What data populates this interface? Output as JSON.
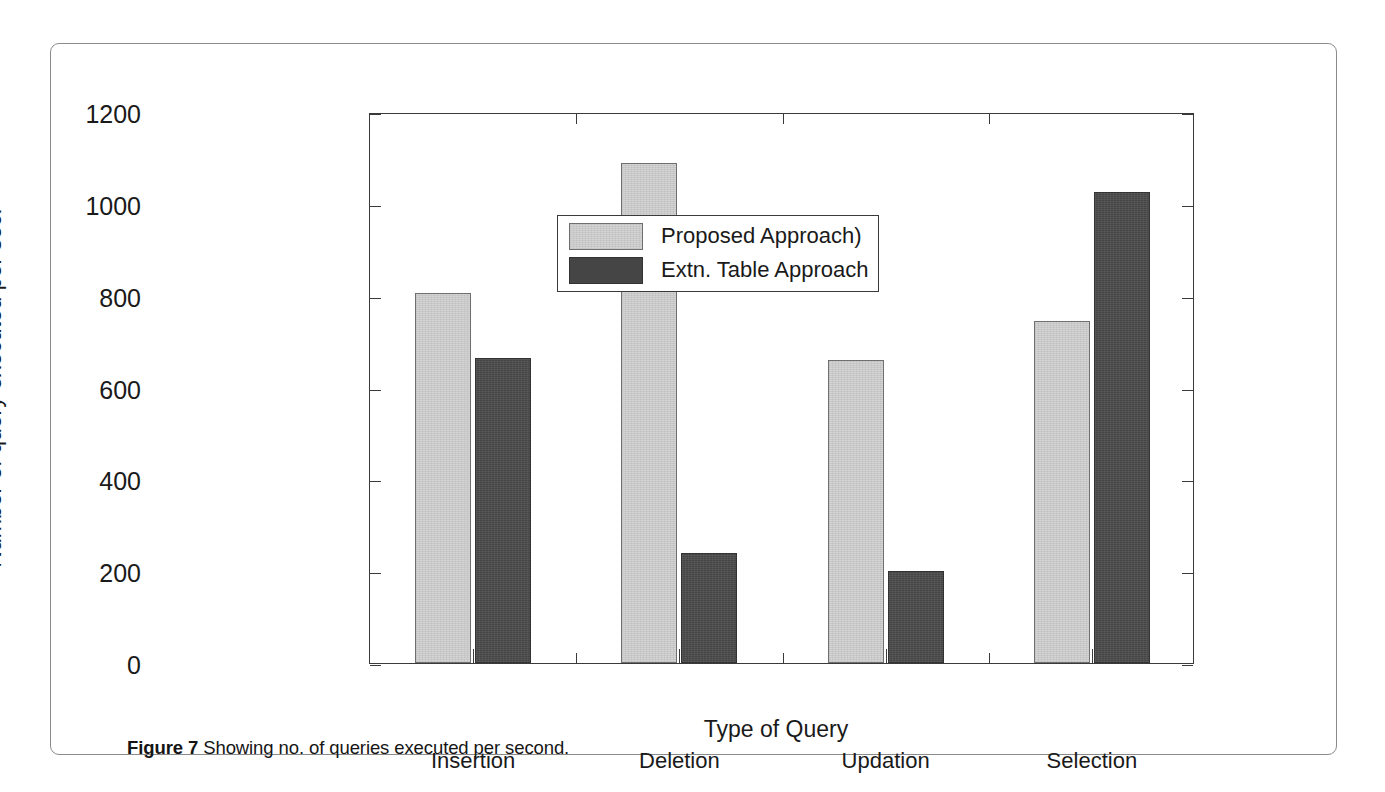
{
  "figure": {
    "caption_label": "Figure 7",
    "caption_text": "Showing no. of queries executed per second."
  },
  "chart_data": {
    "type": "bar",
    "title": "",
    "xlabel": "Type of Query",
    "ylabel": "Number of query executed per sec.",
    "categories": [
      "Insertion",
      "Deletion",
      "Updation",
      "Selection"
    ],
    "series": [
      {
        "name": "Proposed Approach)",
        "color": "#d4d4d4",
        "values": [
          805,
          1090,
          660,
          745
        ]
      },
      {
        "name": "Extn. Table Approach",
        "color": "#454545",
        "values": [
          665,
          240,
          200,
          1025
        ]
      }
    ],
    "ylim": [
      0,
      1200
    ],
    "ytick_labels": [
      "0",
      "200",
      "400",
      "600",
      "800",
      "1000",
      "1200"
    ],
    "ytick_values": [
      0,
      200,
      400,
      600,
      800,
      1000,
      1200
    ],
    "grid": false,
    "legend_position": "upper-center"
  }
}
